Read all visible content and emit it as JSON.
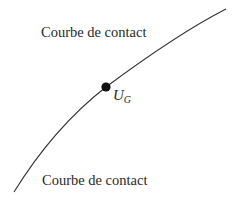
{
  "diagram": {
    "labels": {
      "top": "Courbe de contact",
      "bottom": "Courbe de contact"
    },
    "point": {
      "name_main": "U",
      "name_sub": "G"
    },
    "colors": {
      "curve": "#333333",
      "point": "#111111",
      "text": "#2a2a2a",
      "background": "#ffffff"
    }
  }
}
